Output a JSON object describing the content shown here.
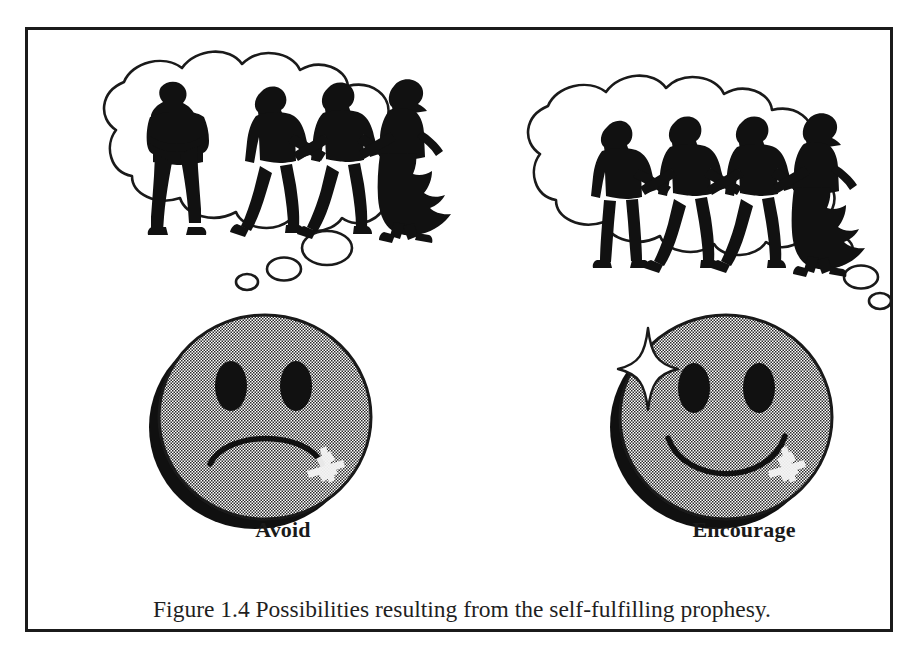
{
  "figure": {
    "caption": "Figure 1.4  Possibilities resulting from the self-fulfilling prophesy.",
    "frame_border_color": "#1b1b1b",
    "background_color": "#ffffff"
  },
  "panels": [
    {
      "id": "avoid",
      "label": "Avoid",
      "face": {
        "expression": "frowning",
        "icon": "sad-face-icon",
        "fill_color": "#b0b0b0",
        "outline_color": "#1a1a1a",
        "shadow_color": "#101010",
        "has_sparkle": false,
        "highlight": "cross-highlight"
      },
      "thought_bubble": {
        "icon": "thought-bubble-icon",
        "outline_color": "#1a1a1a",
        "tail_circle_count": 3,
        "tail_direction": "down-left",
        "scene_description": "one isolated figure standing apart with arms crossed, and three figures holding hands",
        "figures": [
          {
            "role": "isolated-person",
            "posture": "arms-crossed",
            "connected": false
          },
          {
            "role": "man",
            "posture": "walking-holding-hands",
            "connected": true
          },
          {
            "role": "man",
            "posture": "walking-holding-hands",
            "connected": true
          },
          {
            "role": "woman",
            "posture": "walking-holding-hands-in-dress",
            "connected": true
          }
        ]
      }
    },
    {
      "id": "encourage",
      "label": "Encourage",
      "face": {
        "expression": "smiling",
        "icon": "happy-face-icon",
        "fill_color": "#b0b0b0",
        "outline_color": "#1a1a1a",
        "shadow_color": "#101010",
        "has_sparkle": true,
        "highlight": "cross-highlight"
      },
      "thought_bubble": {
        "icon": "thought-bubble-icon",
        "outline_color": "#1a1a1a",
        "tail_circle_count": 3,
        "tail_direction": "down-right",
        "scene_description": "four figures all holding hands together in one connected line",
        "figures": [
          {
            "role": "man",
            "posture": "standing-holding-hands",
            "connected": true
          },
          {
            "role": "man",
            "posture": "walking-holding-hands",
            "connected": true
          },
          {
            "role": "man",
            "posture": "walking-holding-hands",
            "connected": true
          },
          {
            "role": "woman",
            "posture": "walking-holding-hands-in-dress",
            "connected": true
          }
        ]
      }
    }
  ]
}
